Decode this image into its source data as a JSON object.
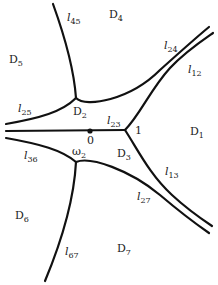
{
  "diagram": {
    "colors": {
      "line": "#111111",
      "background": "#ffffff",
      "text": "#222222"
    },
    "points": {
      "origin": {
        "label": "0",
        "x": 90,
        "y": 131
      },
      "one": {
        "label": "1",
        "x": 125,
        "y": 130
      },
      "omega2": {
        "label": "ω",
        "sub": "2",
        "x": 76,
        "y": 162
      },
      "upper_junction": {
        "x": 76,
        "y": 98
      }
    },
    "regions": [
      {
        "id": "D1",
        "main": "D",
        "sub": "1"
      },
      {
        "id": "D2",
        "main": "D",
        "sub": "2"
      },
      {
        "id": "D3",
        "main": "D",
        "sub": "3"
      },
      {
        "id": "D4",
        "main": "D",
        "sub": "4"
      },
      {
        "id": "D5",
        "main": "D",
        "sub": "5"
      },
      {
        "id": "D6",
        "main": "D",
        "sub": "6"
      },
      {
        "id": "D7",
        "main": "D",
        "sub": "7"
      }
    ],
    "curves": [
      {
        "id": "l45",
        "main": "l",
        "sub": "45"
      },
      {
        "id": "l24",
        "main": "l",
        "sub": "24"
      },
      {
        "id": "l12",
        "main": "l",
        "sub": "12"
      },
      {
        "id": "l25",
        "main": "l",
        "sub": "25"
      },
      {
        "id": "l23",
        "main": "l",
        "sub": "23"
      },
      {
        "id": "l36",
        "main": "l",
        "sub": "36"
      },
      {
        "id": "l13",
        "main": "l",
        "sub": "13"
      },
      {
        "id": "l27",
        "main": "l",
        "sub": "27"
      },
      {
        "id": "l67",
        "main": "l",
        "sub": "67"
      }
    ]
  }
}
